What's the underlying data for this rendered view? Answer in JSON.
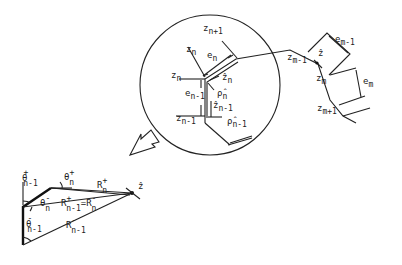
{
  "figure": {
    "circle_detail": {
      "labels": {
        "z_n_plus_1": {
          "base": "z",
          "sub": "n+1"
        },
        "z_n_top": {
          "base": "z",
          "sub": "n"
        },
        "e_n": {
          "base": "e",
          "sub": "n"
        },
        "z_n_left": {
          "base": "z",
          "sub": "n"
        },
        "zhat_n": {
          "base": "ẑ",
          "sub": "n"
        },
        "e_n_minus_1": {
          "base": "e",
          "sub": "n-1"
        },
        "rhohat_n": {
          "base": "ρ̂",
          "sub": "n"
        },
        "zhat_n_minus_1": {
          "base": "ẑ",
          "sub": "n-1"
        },
        "z_n_minus_1": {
          "base": "z",
          "sub": "n-1"
        },
        "rhohat_n_minus_1": {
          "base": "ρ̂",
          "sub": "n-1"
        }
      }
    },
    "right_segment": {
      "labels": {
        "e_m_minus_1": {
          "base": "e",
          "sub": "m-1"
        },
        "z_m_minus_1": {
          "base": "z",
          "sub": "m-1"
        },
        "zhat": {
          "base": "ẑ",
          "sub": ""
        },
        "z_m": {
          "base": "z",
          "sub": "m"
        },
        "e_m": {
          "base": "e",
          "sub": "m"
        },
        "z_m_plus_1": {
          "base": "z",
          "sub": "m+1"
        }
      }
    },
    "triangle_detail": {
      "labels": {
        "theta_plus_n_minus_1": {
          "base": "θ",
          "sup": "+",
          "sub": "n-1"
        },
        "theta_plus_n": {
          "base": "θ",
          "sup": "+",
          "sub": "n"
        },
        "R_plus_n": {
          "base": "R",
          "sup": "+",
          "sub": "n"
        },
        "theta_minus_n": {
          "base": "θ",
          "sup": "-",
          "sub": "n"
        },
        "R_equality": {
          "left_base": "R",
          "left_sup": "+",
          "left_sub": "n-1",
          "eq": "=",
          "right_base": "R",
          "right_sup": "-",
          "right_sub": "n"
        },
        "theta_minus_n_minus_1": {
          "base": "θ",
          "sup": "-",
          "sub": "n-1"
        },
        "R_minus_n_minus_1": {
          "base": "R",
          "sup": "-",
          "sub": "n-1"
        },
        "zhat_point": {
          "base": "ẑ"
        }
      }
    }
  }
}
